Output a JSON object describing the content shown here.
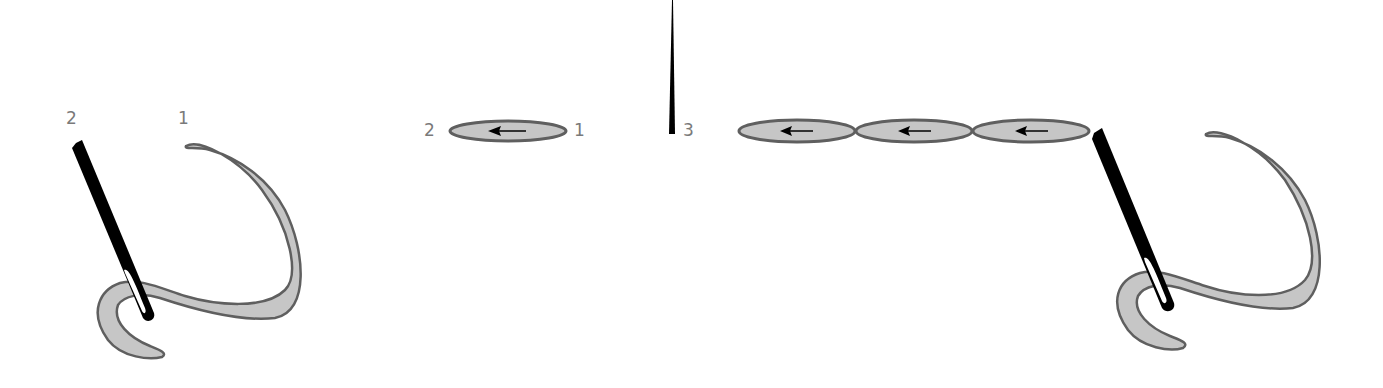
{
  "diagram": {
    "type": "embroidery stitch steps",
    "colors": {
      "thread_fill": "#c6c6c6",
      "thread_outline": "#5f5f5f",
      "needle": "#000000",
      "label": "#7a7a7a",
      "background": "#ffffff"
    },
    "step1": {
      "labels": {
        "needle_point": "2",
        "thread_start": "1"
      }
    },
    "step2": {
      "labels": {
        "left": "2",
        "right": "1"
      },
      "arrow_direction": "left"
    },
    "step3": {
      "labels": {
        "point": "3"
      }
    },
    "step4": {
      "stitch_count": 3,
      "arrow_direction": "left"
    }
  }
}
